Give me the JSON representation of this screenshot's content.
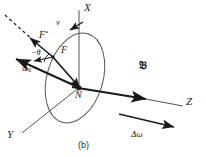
{
  "figure": {
    "caption": "(b)",
    "type": "vector-diagram",
    "background_color": "#ffffff",
    "stroke_color": "#1a1a1a"
  },
  "axes": [
    {
      "id": "x-axis",
      "label": "X",
      "label_x": 86,
      "label_y": 4,
      "x1": 79,
      "y1": 88,
      "x2": 79,
      "y2": 10
    },
    {
      "id": "y-axis",
      "label": "Y",
      "label_x": 8,
      "label_y": 136,
      "x1": 79,
      "y1": 88,
      "x2": 22,
      "y2": 133
    },
    {
      "id": "z-axis",
      "label": "Z",
      "label_x": 188,
      "label_y": 102,
      "x1": 79,
      "y1": 88,
      "x2": 183,
      "y2": 106
    }
  ],
  "disk": {
    "name": "rotating-disk-ellipse",
    "center_x": 75,
    "center_y": 78,
    "radius_x": 46,
    "radius_y": 28,
    "rotation_deg": -74
  },
  "vectors": [
    {
      "id": "vector-F",
      "label": "F",
      "label_x": 62,
      "label_y": 50,
      "x1": 79,
      "y1": 88,
      "x2": 53,
      "y2": 57,
      "style": "solid",
      "arrow": "start"
    },
    {
      "id": "vector-F-star",
      "label": "F",
      "superscript": "*",
      "label_x": 40,
      "label_y": 35,
      "x1": 53,
      "y1": 57,
      "x2": 31,
      "y2": 39,
      "style": "solid",
      "arrow": "end"
    },
    {
      "id": "vector-omega-0",
      "label": "ω",
      "subscript": "0",
      "label_x": 27,
      "label_y": 70,
      "x1": 79,
      "y1": 88,
      "x2": 18,
      "y2": 60,
      "style": "solid",
      "arrow": "end"
    },
    {
      "id": "vector-B",
      "label": "𝔅",
      "label_x": 141,
      "label_y": 66,
      "x1": 79,
      "y1": 88,
      "x2": 150,
      "y2": 100,
      "style": "solid",
      "arrow": "end"
    },
    {
      "id": "vector-delta-omega",
      "label": "Δω",
      "label_x": 132,
      "label_y": 136,
      "x1": 119,
      "y1": 115,
      "x2": 175,
      "y2": 128,
      "style": "solid",
      "arrow": "end"
    },
    {
      "id": "vector-v",
      "label": "v",
      "label_x": 57,
      "label_y": 24,
      "arrow": "tangent-on-ellipse-top"
    },
    {
      "id": "dashed-guide",
      "label": "",
      "x1": 36,
      "y1": 43,
      "x2": 6,
      "y2": 16,
      "style": "dashed",
      "arrow": "none"
    }
  ],
  "angle_marker": {
    "id": "angle-minus-theta",
    "label": "−θ",
    "label_x": 33,
    "label_y": 55
  }
}
